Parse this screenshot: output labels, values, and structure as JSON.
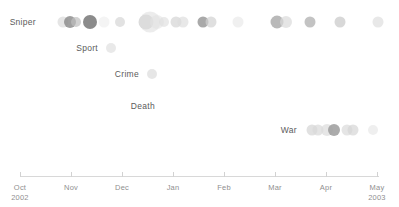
{
  "chart_data": {
    "type": "scatter",
    "title": "",
    "xlabel": "",
    "ylabel": "",
    "grid": false,
    "legend_position": "none",
    "x_axis": {
      "range": [
        "Oct 2002",
        "May 2003"
      ],
      "ticks": [
        {
          "label": "Oct",
          "year": "2002",
          "x": 20
        },
        {
          "label": "Nov",
          "year": "",
          "x": 71
        },
        {
          "label": "Dec",
          "year": "",
          "x": 122
        },
        {
          "label": "Jan",
          "year": "",
          "x": 173
        },
        {
          "label": "Feb",
          "year": "",
          "x": 224
        },
        {
          "label": "Mar",
          "year": "",
          "x": 275
        },
        {
          "label": "Apr",
          "year": "",
          "x": 326
        },
        {
          "label": "May",
          "year": "2003",
          "x": 377
        }
      ]
    },
    "categories": [
      "Sniper",
      "Sport",
      "Crime",
      "Death",
      "War"
    ],
    "series": [
      {
        "name": "Sniper",
        "label_x": 36,
        "label_y": 22,
        "points": [
          {
            "x": 63,
            "y": 22,
            "r": 5.5,
            "shade": "#dcdcdc",
            "alpha": 0.75
          },
          {
            "x": 70,
            "y": 22,
            "r": 6.0,
            "shade": "#8e8e8e",
            "alpha": 0.85
          },
          {
            "x": 76,
            "y": 22,
            "r": 5.0,
            "shade": "#bfbfbf",
            "alpha": 0.7
          },
          {
            "x": 90,
            "y": 22,
            "r": 7.0,
            "shade": "#7e7e7e",
            "alpha": 0.9
          },
          {
            "x": 104,
            "y": 22,
            "r": 5.5,
            "shade": "#ececec",
            "alpha": 0.6
          },
          {
            "x": 120,
            "y": 22,
            "r": 5.0,
            "shade": "#d6d6d6",
            "alpha": 0.7
          },
          {
            "x": 146,
            "y": 22,
            "r": 7.5,
            "shade": "#d0d0d0",
            "alpha": 0.75
          },
          {
            "x": 150,
            "y": 22,
            "r": 10.5,
            "shade": "#dcdcdc",
            "alpha": 0.55
          },
          {
            "x": 157,
            "y": 22,
            "r": 7.0,
            "shade": "#e2e2e2",
            "alpha": 0.6
          },
          {
            "x": 164,
            "y": 22,
            "r": 5.0,
            "shade": "#dedede",
            "alpha": 0.65
          },
          {
            "x": 176,
            "y": 22,
            "r": 5.5,
            "shade": "#d4d4d4",
            "alpha": 0.7
          },
          {
            "x": 183,
            "y": 22,
            "r": 5.5,
            "shade": "#dcdcdc",
            "alpha": 0.65
          },
          {
            "x": 203,
            "y": 22,
            "r": 5.5,
            "shade": "#9a9a9a",
            "alpha": 0.85
          },
          {
            "x": 211,
            "y": 22,
            "r": 5.5,
            "shade": "#d2d2d2",
            "alpha": 0.7
          },
          {
            "x": 238,
            "y": 22,
            "r": 5.5,
            "shade": "#e6e6e6",
            "alpha": 0.6
          },
          {
            "x": 277,
            "y": 22,
            "r": 6.5,
            "shade": "#a8a8a8",
            "alpha": 0.8
          },
          {
            "x": 286,
            "y": 22,
            "r": 6.0,
            "shade": "#dadada",
            "alpha": 0.7
          },
          {
            "x": 310,
            "y": 22,
            "r": 5.5,
            "shade": "#b4b4b4",
            "alpha": 0.8
          },
          {
            "x": 340,
            "y": 22,
            "r": 5.5,
            "shade": "#c8c8c8",
            "alpha": 0.7
          },
          {
            "x": 378,
            "y": 22,
            "r": 5.5,
            "shade": "#dcdcdc",
            "alpha": 0.65
          }
        ]
      },
      {
        "name": "Sport",
        "label_x": 98,
        "label_y": 48,
        "points": [
          {
            "x": 111,
            "y": 48,
            "r": 5.0,
            "shade": "#dfdfdf",
            "alpha": 0.7
          }
        ]
      },
      {
        "name": "Crime",
        "label_x": 139,
        "label_y": 74,
        "points": [
          {
            "x": 152,
            "y": 74,
            "r": 5.0,
            "shade": "#dcdcdc",
            "alpha": 0.7
          }
        ]
      },
      {
        "name": "Death",
        "label_x": 155,
        "label_y": 106,
        "points": []
      },
      {
        "name": "War",
        "label_x": 297,
        "label_y": 130,
        "points": [
          {
            "x": 312,
            "y": 130,
            "r": 5.5,
            "shade": "#d4d4d4",
            "alpha": 0.7
          },
          {
            "x": 318,
            "y": 130,
            "r": 5.5,
            "shade": "#d8d8d8",
            "alpha": 0.7
          },
          {
            "x": 327,
            "y": 130,
            "r": 6.0,
            "shade": "#dcdcdc",
            "alpha": 0.7
          },
          {
            "x": 334,
            "y": 130,
            "r": 6.0,
            "shade": "#9c9c9c",
            "alpha": 0.85
          },
          {
            "x": 347,
            "y": 130,
            "r": 5.5,
            "shade": "#dadada",
            "alpha": 0.7
          },
          {
            "x": 353,
            "y": 130,
            "r": 5.5,
            "shade": "#d6d6d6",
            "alpha": 0.7
          },
          {
            "x": 373,
            "y": 130,
            "r": 5.0,
            "shade": "#e4e4e4",
            "alpha": 0.6
          }
        ]
      }
    ]
  },
  "colors": {
    "axis": "#d8d8d8",
    "tick": "#d2d2d2",
    "row_label": "#5b5b5b",
    "tick_label": "#8f8f8f",
    "background": "#ffffff"
  },
  "axis_geometry": {
    "line_y": 176,
    "line_x1": 20,
    "line_x2": 379,
    "tick_top": 172,
    "tick_height": 5,
    "label_y": 183
  }
}
